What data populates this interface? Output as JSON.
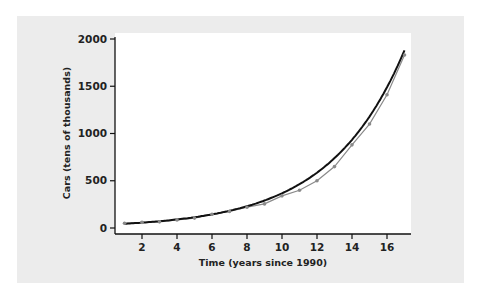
{
  "chart_data": {
    "type": "line",
    "title": "",
    "xlabel": "Time (years since 1990)",
    "ylabel": "Cars (tens of thousands)",
    "xlim": [
      0.5,
      17.5
    ],
    "ylim": [
      0,
      2000
    ],
    "x_ticks": [
      2,
      4,
      6,
      8,
      10,
      12,
      14,
      16
    ],
    "y_ticks": [
      0,
      500,
      1000,
      1500,
      2000
    ],
    "grid": false,
    "legend": null,
    "series": [
      {
        "name": "Data",
        "style": "grey markers with line",
        "x": [
          1,
          2,
          3,
          4,
          5,
          6,
          7,
          8,
          9,
          10,
          11,
          12,
          13,
          14,
          15,
          16,
          17
        ],
        "values": [
          50,
          60,
          65,
          85,
          105,
          145,
          175,
          220,
          255,
          340,
          400,
          500,
          650,
          880,
          1100,
          1410,
          1830
        ]
      },
      {
        "name": "Exponential fit",
        "style": "solid black curve",
        "x": [
          1,
          2,
          3,
          4,
          5,
          6,
          7,
          8,
          9,
          10,
          11,
          12,
          13,
          14,
          15,
          16,
          17
        ],
        "values": [
          48,
          58,
          70,
          85,
          104,
          127,
          155,
          190,
          232,
          283,
          346,
          422,
          515,
          630,
          770,
          1170,
          1880
        ]
      }
    ]
  },
  "colors": {
    "panel_background": "#ececec",
    "plot_background": "#ffffff",
    "fit_line": "#111111",
    "data_points": "#8a8a8a"
  }
}
